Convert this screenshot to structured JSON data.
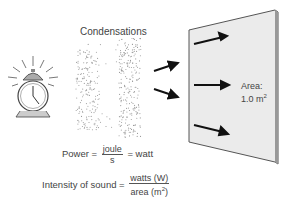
{
  "diagram": {
    "title": "Condensations",
    "wall": {
      "label_line1": "Area:",
      "label_line2": "1.0 m",
      "label_sup": "2"
    },
    "equations": {
      "power": {
        "lhs": "Power =",
        "numerator": "joule",
        "denominator": "s",
        "rhs": "= watt"
      },
      "intensity": {
        "lhs": "Intensity of sound =",
        "numerator": "watts (W)",
        "denominator_text": "area (m",
        "denominator_sup": "2",
        "denominator_close": ")"
      }
    },
    "colors": {
      "wall_face": "#ebebeb",
      "wall_edge": "#555555",
      "arrow": "#111111",
      "dots": "#9a9a9a",
      "clock_bell": "#aaaaaa"
    }
  }
}
